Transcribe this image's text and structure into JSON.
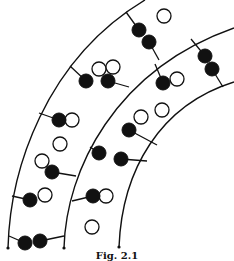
{
  "figure": {
    "caption": "Fig. 2.1",
    "colors": {
      "stroke": "#111111",
      "filled_atom": "#111111",
      "open_atom": "#ffffff",
      "background": "#ffffff"
    },
    "arcs": [
      {
        "id": "arc-1",
        "d": "M8,248 C10,170 45,60 145,0"
      },
      {
        "id": "arc-2",
        "d": "M64,248 C66,170 115,70 234,28"
      },
      {
        "id": "arc-3",
        "d": "M119,247 C122,170 160,105 234,82"
      }
    ],
    "endpoints": [
      {
        "x": 8,
        "y": 248
      },
      {
        "x": 64,
        "y": 248
      },
      {
        "x": 119,
        "y": 247
      }
    ],
    "bonds": [
      {
        "x1": 126,
        "y1": 12,
        "x2": 139,
        "y2": 30
      },
      {
        "x1": 149,
        "y1": 42,
        "x2": 159,
        "y2": 60
      },
      {
        "x1": 70,
        "y1": 66,
        "x2": 86,
        "y2": 81
      },
      {
        "x1": 108,
        "y1": 81,
        "x2": 129,
        "y2": 87
      },
      {
        "x1": 39,
        "y1": 113,
        "x2": 59,
        "y2": 120
      },
      {
        "x1": 52,
        "y1": 172,
        "x2": 76,
        "y2": 176
      },
      {
        "x1": 12,
        "y1": 196,
        "x2": 30,
        "y2": 200
      },
      {
        "x1": 9,
        "y1": 236,
        "x2": 25,
        "y2": 243
      },
      {
        "x1": 40,
        "y1": 241,
        "x2": 64,
        "y2": 236
      },
      {
        "x1": 155,
        "y1": 64,
        "x2": 163,
        "y2": 83
      },
      {
        "x1": 129,
        "y1": 130,
        "x2": 157,
        "y2": 145
      },
      {
        "x1": 191,
        "y1": 39,
        "x2": 205,
        "y2": 56
      },
      {
        "x1": 212,
        "y1": 69,
        "x2": 223,
        "y2": 87
      },
      {
        "x1": 90,
        "y1": 147,
        "x2": 99,
        "y2": 153
      },
      {
        "x1": 121,
        "y1": 159,
        "x2": 147,
        "y2": 161
      },
      {
        "x1": 72,
        "y1": 201,
        "x2": 93,
        "y2": 196
      }
    ],
    "atoms_filled": [
      {
        "x": 139,
        "y": 30
      },
      {
        "x": 149,
        "y": 42
      },
      {
        "x": 86,
        "y": 81
      },
      {
        "x": 108,
        "y": 81
      },
      {
        "x": 59,
        "y": 120
      },
      {
        "x": 52,
        "y": 172
      },
      {
        "x": 30,
        "y": 200
      },
      {
        "x": 25,
        "y": 243
      },
      {
        "x": 40,
        "y": 241
      },
      {
        "x": 163,
        "y": 83
      },
      {
        "x": 129,
        "y": 130
      },
      {
        "x": 205,
        "y": 56
      },
      {
        "x": 212,
        "y": 69
      },
      {
        "x": 99,
        "y": 153
      },
      {
        "x": 121,
        "y": 159
      },
      {
        "x": 93,
        "y": 196
      }
    ],
    "atoms_open": [
      {
        "x": 164,
        "y": 16
      },
      {
        "x": 99,
        "y": 69
      },
      {
        "x": 113,
        "y": 67
      },
      {
        "x": 72,
        "y": 120
      },
      {
        "x": 60,
        "y": 144
      },
      {
        "x": 42,
        "y": 161
      },
      {
        "x": 45,
        "y": 195
      },
      {
        "x": 177,
        "y": 79
      },
      {
        "x": 162,
        "y": 110
      },
      {
        "x": 141,
        "y": 117
      },
      {
        "x": 106,
        "y": 196
      },
      {
        "x": 92,
        "y": 227
      }
    ],
    "atom_radius": 7
  }
}
